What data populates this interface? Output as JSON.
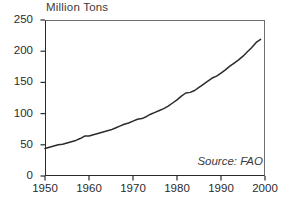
{
  "chart_data": {
    "type": "line",
    "title": "Million Tons",
    "xlabel": "",
    "ylabel": "Million Tons",
    "xlim": [
      1950,
      2000
    ],
    "ylim": [
      0,
      250
    ],
    "grid": false,
    "legend": null,
    "annotations": [
      {
        "name": "source",
        "text": "Source: FAO",
        "position": "bottom-right-inside"
      }
    ],
    "yticks": [
      0,
      50,
      100,
      150,
      200,
      250
    ],
    "ytick_labels": [
      "0",
      "50",
      "100",
      "150",
      "200",
      "250"
    ],
    "xticks": [
      1950,
      1960,
      1970,
      1980,
      1990,
      2000
    ],
    "xtick_labels": [
      "1950",
      "1960",
      "1970",
      "1980",
      "1990",
      "2000"
    ],
    "series": [
      {
        "name": "World production",
        "color": "#2b2b2b",
        "x": [
          1950,
          1951,
          1952,
          1953,
          1954,
          1955,
          1956,
          1957,
          1958,
          1959,
          1960,
          1961,
          1962,
          1963,
          1964,
          1965,
          1966,
          1967,
          1968,
          1969,
          1970,
          1971,
          1972,
          1973,
          1974,
          1975,
          1976,
          1977,
          1978,
          1979,
          1980,
          1981,
          1982,
          1983,
          1984,
          1985,
          1986,
          1987,
          1988,
          1989,
          1990,
          1991,
          1992,
          1993,
          1994,
          1995,
          1996,
          1997,
          1998,
          1999
        ],
        "values": [
          44,
          46,
          48,
          50,
          51,
          53,
          55,
          57,
          60,
          64,
          64,
          66,
          68,
          70,
          72,
          74,
          77,
          80,
          83,
          85,
          88,
          91,
          92,
          95,
          99,
          102,
          105,
          108,
          112,
          117,
          122,
          128,
          133,
          134,
          137,
          142,
          147,
          152,
          157,
          160,
          165,
          170,
          176,
          181,
          186,
          192,
          199,
          206,
          214,
          219
        ]
      }
    ]
  },
  "axis": {
    "y_title": "Million Tons"
  },
  "source": {
    "text": "Source: FAO"
  }
}
